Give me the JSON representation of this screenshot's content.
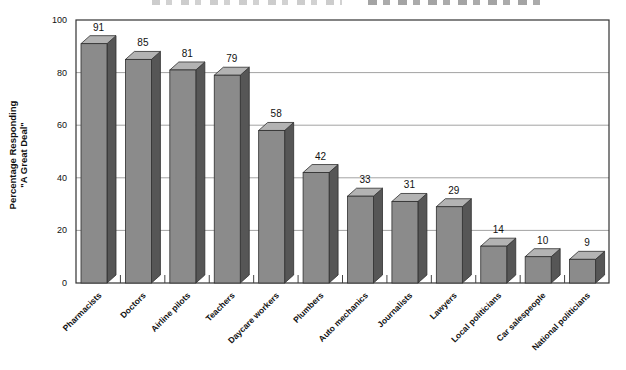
{
  "page": {
    "background": "#ffffff",
    "title_cropped_at_top": true
  },
  "chart_data": {
    "type": "bar",
    "style": "3d-column",
    "title": "",
    "ylabel_line1": "Percentage Responding",
    "ylabel_line2": "\"A Great Deal\"",
    "xlabel": "",
    "categories": [
      "Pharmacists",
      "Doctors",
      "Airline pilots",
      "Teachers",
      "Daycare workers",
      "Plumbers",
      "Auto mechanics",
      "Journalists",
      "Lawyers",
      "Local politicians",
      "Car salespeople",
      "National politicians"
    ],
    "values": [
      91,
      85,
      81,
      79,
      58,
      42,
      33,
      31,
      29,
      14,
      10,
      9
    ],
    "ylim": [
      0,
      100
    ],
    "yticks": [
      0,
      20,
      40,
      60,
      80,
      100
    ],
    "grid": true,
    "legend": "none",
    "colors": {
      "bar_front": "#8b8b8b",
      "bar_top": "#b3b3b3",
      "bar_side": "#565656",
      "bar_outline": "#2f2f2f",
      "gridline": "#a3a3a3",
      "plot_border": "#333333",
      "tick": "#444444",
      "text": "#111111"
    }
  }
}
